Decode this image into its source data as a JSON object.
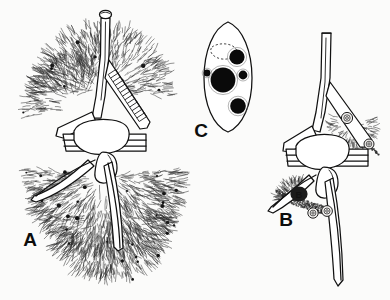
{
  "figure": {
    "background_color": "#fbfbfa",
    "ink_color": "#111111",
    "caption_font_color": "#0d0d0d",
    "panels": [
      {
        "id": "A",
        "label": "A",
        "label_x": 30,
        "label_y": 246,
        "description": "Heavily infected dinoflagellate cell with dense radiating filament growth covering epitheca and hypotheca",
        "features": [
          "apical-horn",
          "apical-pore-cap",
          "cingulum",
          "left-antapical-horn",
          "right-antapical-horn",
          "ladder-structure",
          "dense-filament-mat"
        ]
      },
      {
        "id": "B",
        "label": "B",
        "label_x": 286,
        "label_y": 226,
        "description": "Dinoflagellate cell with localized parasite cysts on right epithecal horn and on hypothecal region",
        "features": [
          "apical-horn",
          "cingulum",
          "left-antapical-horn",
          "right-antapical-horn",
          "parasite-cyst",
          "stippled-patch"
        ]
      },
      {
        "id": "C",
        "label": "C",
        "label_x": 201,
        "label_y": 137,
        "description": "Isolated ovoid parasite cell showing large central nucleus, three smaller dark bodies and a dashed vacuole outline",
        "features": [
          "cell-outline",
          "central-nucleus",
          "upper-right-body",
          "right-small-body",
          "left-small-body",
          "lower-body",
          "dashed-vacuole"
        ]
      }
    ],
    "inline_markers": [
      {
        "text": "B",
        "x": 299,
        "y": 196,
        "panel": "B",
        "description": "dark infection patch marker on hypotheca"
      }
    ]
  },
  "chart_data": {
    "type": "diagram",
    "title": "",
    "panel_ids": [
      "A",
      "B",
      "C"
    ],
    "panel_labels": [
      "A",
      "B",
      "C"
    ]
  }
}
